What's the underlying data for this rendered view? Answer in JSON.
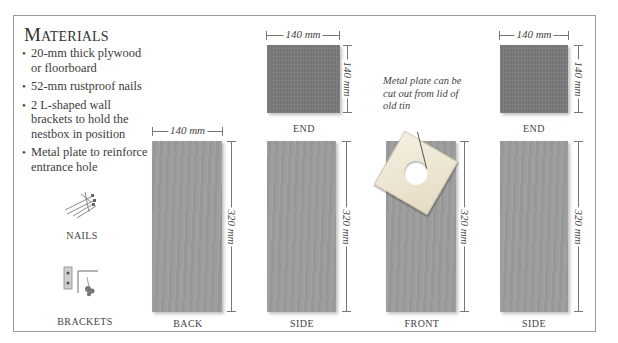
{
  "heading": {
    "first_letter": "M",
    "rest": "ATERIALS"
  },
  "materials": [
    "20-mm thick plywood or floorboard",
    "52-mm rustproof nails",
    "2 L-shaped wall brackets to hold the nestbox in position",
    "Metal plate to reinforce entrance hole"
  ],
  "items": {
    "nails": {
      "label": "NAILS",
      "icon": "nails-icon"
    },
    "brackets": {
      "label": "BRACKETS",
      "icon": "brackets-icon"
    }
  },
  "panels": {
    "end_1": {
      "label": "END",
      "width": "140 mm",
      "height": "140 mm"
    },
    "end_2": {
      "label": "END",
      "width": "140 mm",
      "height": "140 mm"
    },
    "back": {
      "label": "BACK",
      "width": "140 mm",
      "height": "320 mm"
    },
    "side_1": {
      "label": "SIDE",
      "height": "320 mm"
    },
    "front": {
      "label": "FRONT",
      "height": "320 mm"
    },
    "side_2": {
      "label": "SIDE",
      "height": "320 mm"
    }
  },
  "note": "Metal plate can be cut out from lid of old tin",
  "colors": {
    "end_panel": "#7b7b7b",
    "long_panel": "#9c9c9c",
    "frame": "#9a9a9a",
    "plate": "#efe8d6"
  }
}
